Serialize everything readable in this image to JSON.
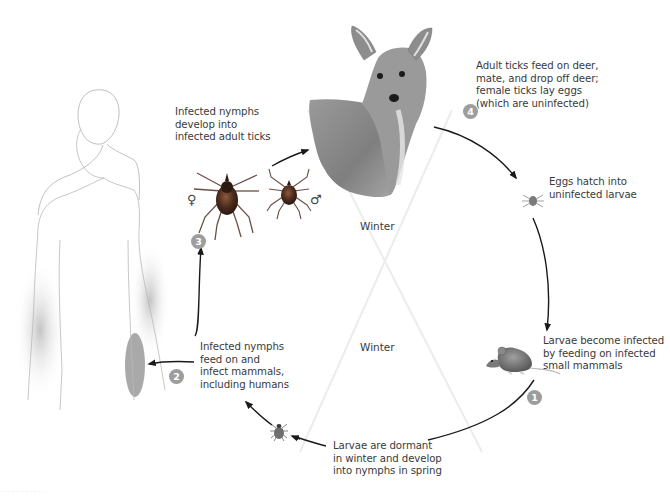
{
  "diagram": {
    "type": "cycle",
    "stages": [
      {
        "number": "1",
        "text": "Larvae become infected\nby feeding on infected\nsmall mammals",
        "host": "mouse"
      },
      {
        "number": "2",
        "text": "Infected nymphs\nfeed on and\ninfect mammals,\nincluding humans",
        "host": "human"
      },
      {
        "number": "3",
        "text": "Infected nymphs\ndevelop into\ninfected adult ticks",
        "host": "adult ticks"
      },
      {
        "number": "4",
        "text": "Adult ticks feed on deer,\nmate, and drop off deer;\nfemale ticks lay eggs\n(which are uninfected)",
        "host": "deer"
      }
    ],
    "transitions": [
      {
        "text": "Eggs hatch into\nuninfected larvae"
      },
      {
        "text": "Larvae are dormant\nin winter and develop\ninto nymphs in spring"
      }
    ],
    "seasons": {
      "top": "Winter",
      "bottom": "Winter"
    },
    "symbols": {
      "female": "♀",
      "male": "♂"
    },
    "credit": "· · ·  ·· ·· ·· ··  · ·· · ·"
  },
  "colors": {
    "text": "#3a3a3a",
    "arrow": "#1a1a1a",
    "badge": "#9d9d9d",
    "cross_lines": "#ececec",
    "tick_body": "#4a2a1c"
  }
}
